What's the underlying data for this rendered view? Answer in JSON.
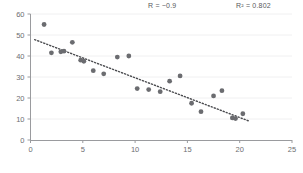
{
  "chart_data": {
    "type": "scatter",
    "title": "",
    "xlabel": "",
    "ylabel": "",
    "xlim": [
      0,
      25
    ],
    "ylim": [
      0,
      60
    ],
    "xticks": [
      0,
      5,
      10,
      15,
      20,
      25
    ],
    "yticks": [
      0,
      10,
      20,
      30,
      40,
      50,
      60
    ],
    "grid": true,
    "grid_axis": "y",
    "legend": "none",
    "marker_color": "#6b6c70",
    "marker_size": 4,
    "points": [
      {
        "x": 1.3,
        "y": 55.0
      },
      {
        "x": 2.0,
        "y": 41.5
      },
      {
        "x": 2.9,
        "y": 42.0
      },
      {
        "x": 3.2,
        "y": 42.3
      },
      {
        "x": 4.0,
        "y": 46.5
      },
      {
        "x": 4.8,
        "y": 38.0
      },
      {
        "x": 5.1,
        "y": 37.5
      },
      {
        "x": 6.0,
        "y": 33.0
      },
      {
        "x": 7.0,
        "y": 31.5
      },
      {
        "x": 8.3,
        "y": 39.5
      },
      {
        "x": 9.4,
        "y": 40.0
      },
      {
        "x": 10.2,
        "y": 24.5
      },
      {
        "x": 11.3,
        "y": 24.0
      },
      {
        "x": 12.4,
        "y": 23.0
      },
      {
        "x": 13.3,
        "y": 28.0
      },
      {
        "x": 14.3,
        "y": 30.5
      },
      {
        "x": 15.4,
        "y": 17.5
      },
      {
        "x": 16.3,
        "y": 13.5
      },
      {
        "x": 17.5,
        "y": 21.0
      },
      {
        "x": 18.3,
        "y": 23.5
      },
      {
        "x": 19.3,
        "y": 10.5
      },
      {
        "x": 19.6,
        "y": 10.2
      },
      {
        "x": 20.3,
        "y": 12.5
      }
    ],
    "trendline": {
      "type": "linear",
      "color": "#4a4b4f",
      "style": "dotted",
      "x_start": 0.4,
      "y_start": 47.8,
      "x_end": 20.9,
      "y_end": 9.0
    },
    "annotations": [
      {
        "name": "correlation",
        "text": "R = −0.9"
      },
      {
        "name": "r-squared",
        "text": "R² = 0.802"
      }
    ]
  },
  "axes": {
    "x_tick_labels": [
      "0",
      "5",
      "10",
      "15",
      "20",
      "25"
    ],
    "y_tick_labels": [
      "0",
      "10",
      "20",
      "30",
      "40",
      "50",
      "60"
    ]
  },
  "annotations": {
    "correlation_label": "R = −0.9",
    "r_squared_label": "R² = 0.802"
  }
}
